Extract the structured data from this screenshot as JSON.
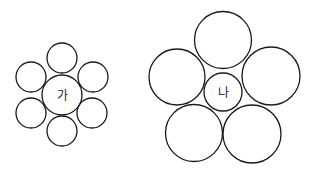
{
  "figures": [
    {
      "id": "ga",
      "label": "가",
      "center_count": 1,
      "surrounding_count": 6
    },
    {
      "id": "na",
      "label": "나",
      "center_count": 1,
      "surrounding_count": 5
    }
  ]
}
